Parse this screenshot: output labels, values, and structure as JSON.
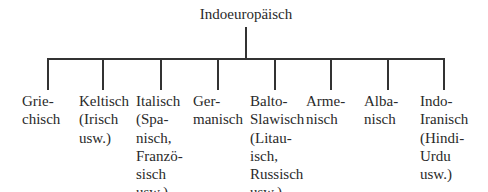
{
  "root": {
    "label": "Indoeuropäisch",
    "x": 246
  },
  "line_color": "#333333",
  "text_color": "#2a2a2a",
  "branches": [
    {
      "name": "Griechisch",
      "stem_x": 47,
      "text_x": 22,
      "lines": [
        "Grie-",
        "chisch"
      ]
    },
    {
      "name": "Keltisch",
      "stem_x": 102,
      "text_x": 79,
      "lines": [
        "Keltisch",
        "(Irisch",
        "usw.)"
      ]
    },
    {
      "name": "Italisch",
      "stem_x": 160,
      "text_x": 136,
      "lines": [
        "Italisch",
        "(Spa-",
        "nisch,",
        "Franzö-",
        "sisch",
        "usw.)"
      ]
    },
    {
      "name": "Germanisch",
      "stem_x": 217,
      "text_x": 193,
      "lines": [
        "Ger-",
        "manisch"
      ]
    },
    {
      "name": "Balto-Slawisch",
      "stem_x": 274,
      "text_x": 250,
      "lines": [
        "Balto-",
        "Slawisch",
        "(Litau-",
        "isch,",
        "Russisch",
        "usw.)"
      ]
    },
    {
      "name": "Armenisch",
      "stem_x": 330,
      "text_x": 306,
      "lines": [
        "Arme-",
        "nisch"
      ]
    },
    {
      "name": "Albanisch",
      "stem_x": 387,
      "text_x": 364,
      "lines": [
        "Alba-",
        "nisch"
      ]
    },
    {
      "name": "Indo-Iranisch",
      "stem_x": 444,
      "text_x": 420,
      "lines": [
        "Indo-",
        "Iranisch",
        "(Hindi-",
        "Urdu",
        "usw.)"
      ]
    }
  ]
}
